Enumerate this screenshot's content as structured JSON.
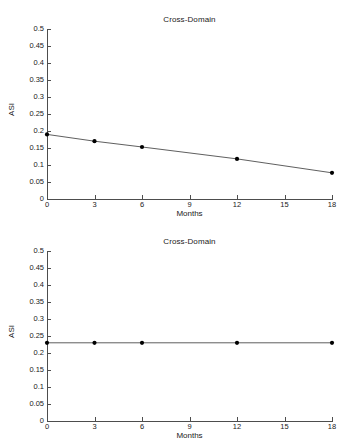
{
  "figure": {
    "background": "#ffffff",
    "line_color": "#4d4d4d",
    "marker_color": "#000000",
    "text_color": "#1a1a1a"
  },
  "chart_data": [
    {
      "type": "line",
      "panel": "top",
      "title": "Cross-Domain",
      "xlabel": "Months",
      "ylabel": "ASI",
      "x": [
        0,
        3,
        6,
        12,
        18
      ],
      "values": [
        0.19,
        0.17,
        0.153,
        0.118,
        0.077
      ],
      "xlim": [
        0,
        18
      ],
      "ylim": [
        0,
        0.5
      ],
      "xticks": [
        0,
        3,
        6,
        9,
        12,
        15,
        18
      ],
      "xticklabels": [
        "0",
        "3",
        "6",
        "9",
        "12",
        "15",
        "18"
      ],
      "yticks": [
        0,
        0.05,
        0.1,
        0.15,
        0.2,
        0.25,
        0.3,
        0.35,
        0.4,
        0.45,
        0.5
      ],
      "yticklabels": [
        "0",
        "0.05",
        "0.1",
        "0.15",
        "0.2",
        "0.25",
        "0.3",
        "0.35",
        "0.4",
        "0.45",
        "0.5"
      ],
      "grid": false,
      "legend": null,
      "marker": "filled-circle"
    },
    {
      "type": "line",
      "panel": "bottom",
      "title": "Cross-Domain",
      "xlabel": "Months",
      "ylabel": "ASI",
      "x": [
        0,
        3,
        6,
        12,
        18
      ],
      "values": [
        0.23,
        0.23,
        0.23,
        0.23,
        0.23
      ],
      "xlim": [
        0,
        18
      ],
      "ylim": [
        0,
        0.5
      ],
      "xticks": [
        0,
        3,
        6,
        9,
        12,
        15,
        18
      ],
      "xticklabels": [
        "0",
        "3",
        "6",
        "9",
        "12",
        "15",
        "18"
      ],
      "yticks": [
        0,
        0.05,
        0.1,
        0.15,
        0.2,
        0.25,
        0.3,
        0.35,
        0.4,
        0.45,
        0.5
      ],
      "yticklabels": [
        "0",
        "0.05",
        "0.1",
        "0.15",
        "0.2",
        "0.25",
        "0.3",
        "0.35",
        "0.4",
        "0.45",
        "0.5"
      ],
      "grid": false,
      "legend": null,
      "marker": "filled-circle"
    }
  ]
}
